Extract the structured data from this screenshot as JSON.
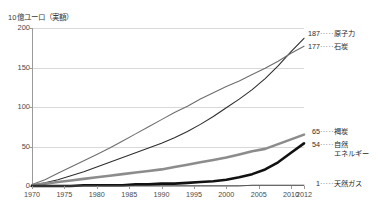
{
  "chart_data": {
    "type": "line",
    "title": "10億ユーロ（実額）",
    "xlabel": "",
    "ylabel": "10億ユーロ（実額）",
    "xlim": [
      1970,
      2012
    ],
    "ylim": [
      0,
      200
    ],
    "grid": true,
    "legend_position": "right-inline-callouts",
    "x_ticks": [
      "1970",
      "1975",
      "1980",
      "1985",
      "1990",
      "1995",
      "2000",
      "2005",
      "2010",
      "2012"
    ],
    "y_ticks": [
      "0",
      "50",
      "100",
      "150",
      "200"
    ],
    "x": [
      1970,
      1972,
      1974,
      1976,
      1978,
      1980,
      1982,
      1984,
      1986,
      1988,
      1990,
      1992,
      1994,
      1996,
      1998,
      2000,
      2002,
      2004,
      2006,
      2008,
      2010,
      2012
    ],
    "series": [
      {
        "name": "原子力",
        "end_value": 187,
        "end_label": "187",
        "color": "#2e2e2e",
        "width": 1.1,
        "values": [
          1,
          4,
          8,
          13,
          18,
          24,
          30,
          36,
          42,
          48,
          54,
          61,
          69,
          78,
          88,
          99,
          110,
          122,
          136,
          152,
          170,
          187
        ]
      },
      {
        "name": "石炭",
        "end_value": 177,
        "end_label": "177",
        "color": "#6e6e6e",
        "width": 1.1,
        "values": [
          2,
          8,
          16,
          24,
          32,
          40,
          48,
          57,
          66,
          75,
          84,
          93,
          101,
          110,
          118,
          126,
          133,
          141,
          149,
          158,
          168,
          177
        ]
      },
      {
        "name": "褐炭",
        "end_value": 65,
        "end_label": "65",
        "color": "#8c8c8c",
        "width": 2.6,
        "values": [
          1,
          3,
          5,
          7,
          9,
          11,
          13,
          15,
          17,
          19,
          21,
          24,
          27,
          30,
          33,
          36,
          40,
          44,
          47,
          53,
          59,
          65
        ]
      },
      {
        "name": "自然エネルギー",
        "end_value": 54,
        "end_label": "54",
        "color": "#111111",
        "width": 2.6,
        "values": [
          0,
          0,
          0,
          0,
          1,
          1,
          1,
          1,
          2,
          2,
          3,
          3,
          4,
          5,
          6,
          8,
          11,
          15,
          21,
          30,
          42,
          54
        ]
      },
      {
        "name": "天然ガス",
        "end_value": 1,
        "end_label": "1",
        "color": "#555555",
        "width": 1.0,
        "values": [
          0,
          0,
          0,
          0,
          0,
          0,
          0,
          0,
          0,
          0,
          0,
          0,
          0,
          0,
          0,
          0,
          0,
          1,
          1,
          1,
          1,
          1
        ]
      }
    ],
    "callouts": [
      {
        "value": "187",
        "dots": "·····",
        "name": "原子力"
      },
      {
        "value": "177",
        "dots": "·····",
        "name": "石炭"
      },
      {
        "value": "65",
        "dots": "·····",
        "name": "褐炭"
      },
      {
        "value": "54",
        "dots": "·····",
        "name": "自然\nエネルギー"
      },
      {
        "value": "1",
        "dots": "·····",
        "name": "天然ガス"
      }
    ]
  }
}
